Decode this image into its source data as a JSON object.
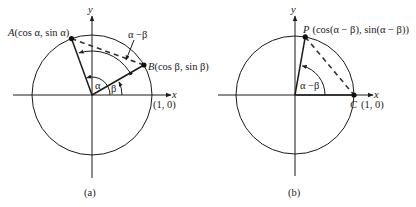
{
  "panels": [
    {
      "id": "a",
      "caption": "(a)",
      "x_axis_label": "x",
      "y_axis_label": "y",
      "unit_point_label": "(1, 0)",
      "points": [
        {
          "name": "A",
          "coords": "(cos α, sin α)",
          "angle_deg": 110
        },
        {
          "name": "B",
          "coords": "(cos β, sin β)",
          "angle_deg": 30
        }
      ],
      "angles": [
        {
          "label": "α",
          "from_deg": 0,
          "to_deg": 110
        },
        {
          "label": "β",
          "from_deg": 0,
          "to_deg": 30
        },
        {
          "label": "α −β",
          "from_deg": 30,
          "to_deg": 110
        }
      ],
      "chord": "A-B (dashed)"
    },
    {
      "id": "b",
      "caption": "(b)",
      "x_axis_label": "x",
      "y_axis_label": "y",
      "points": [
        {
          "name": "P",
          "coords": "(cos(α − β), sin(α − β))",
          "angle_deg": 80
        },
        {
          "name": "C",
          "coords": "(1, 0)",
          "angle_deg": 0
        }
      ],
      "angles": [
        {
          "label": "α −β",
          "from_deg": 0,
          "to_deg": 80
        }
      ],
      "chord": "P-C (dashed)"
    }
  ]
}
